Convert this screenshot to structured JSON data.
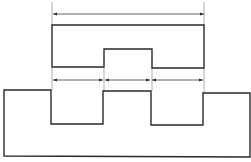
{
  "diagram": {
    "title": "",
    "stroke_color": "#2a2a2a",
    "dim_color": "#3a3a3a",
    "background": "#ffffff",
    "shapes": {
      "upper_block": {
        "description": "Upper part with central raised notch cut from bottom",
        "points": [
          [
            52,
            25
          ],
          [
            204,
            25
          ],
          [
            204,
            68
          ],
          [
            152,
            68
          ],
          [
            152,
            49
          ],
          [
            104,
            49
          ],
          [
            104,
            67
          ],
          [
            52,
            67
          ]
        ]
      },
      "lower_block": {
        "description": "Lower base part with two rectangular notches and central tooth",
        "points": [
          [
            4,
            90
          ],
          [
            51,
            90
          ],
          [
            51,
            124
          ],
          [
            103,
            124
          ],
          [
            103,
            91
          ],
          [
            151,
            91
          ],
          [
            151,
            125
          ],
          [
            203,
            125
          ],
          [
            203,
            93
          ],
          [
            250,
            93
          ],
          [
            250,
            157
          ],
          [
            4,
            156
          ]
        ]
      }
    },
    "dimensions": [
      {
        "name": "overall-width",
        "x1": 53,
        "x2": 204,
        "y": 14,
        "label": ""
      },
      {
        "name": "left-slot-width",
        "x1": 53,
        "x2": 103,
        "y": 80,
        "label": ""
      },
      {
        "name": "center-width",
        "x1": 105,
        "x2": 150,
        "y": 80,
        "label": ""
      },
      {
        "name": "right-slot-width",
        "x1": 152,
        "x2": 203,
        "y": 80,
        "label": ""
      }
    ],
    "extension_lines": [
      {
        "x": 52,
        "y1": 2,
        "y2": 25
      },
      {
        "x": 204,
        "y1": 2,
        "y2": 25
      },
      {
        "x": 52,
        "y1": 68,
        "y2": 90
      },
      {
        "x": 104,
        "y1": 68,
        "y2": 91
      },
      {
        "x": 152,
        "y1": 68,
        "y2": 91
      },
      {
        "x": 204,
        "y1": 68,
        "y2": 93
      }
    ]
  }
}
